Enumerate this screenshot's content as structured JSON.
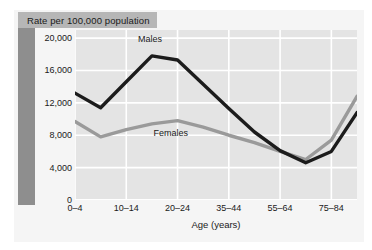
{
  "banner": {
    "text": "Rate per 100,000 population"
  },
  "series_labels": {
    "males": "Males",
    "females": "Females"
  },
  "colors": {
    "males_line": "#1c1c1c",
    "females_line": "#9a9a9a",
    "plot_background": "#e4e4e4",
    "panel_background": "#f5f5f5",
    "banner_background": "#b6b6b6",
    "spine": "#8e8e8e",
    "gridline": "#ffffff"
  },
  "chart_data": {
    "type": "line",
    "title": "Rate per 100,000 population",
    "xlabel": "Age (years)",
    "ylabel": "",
    "ylim": [
      0,
      21000
    ],
    "yticks": [
      0,
      4000,
      8000,
      12000,
      16000,
      20000
    ],
    "ytick_labels": [
      "0",
      "4,000",
      "8,000",
      "12,000",
      "16,000",
      "20,000"
    ],
    "grid": true,
    "legend": "inline-annotations",
    "categories": [
      "0–4",
      "5–9",
      "10–14",
      "15–19",
      "20–24",
      "25–34",
      "35–44",
      "45–54",
      "55–64",
      "65–74",
      "75–84",
      "85+"
    ],
    "xtick_labels": [
      "0–4",
      "10–14",
      "20–24",
      "35–44",
      "55–64",
      "75–84"
    ],
    "xtick_indices": [
      0,
      2,
      4,
      6,
      8,
      10
    ],
    "series": [
      {
        "name": "Males",
        "color": "#1c1c1c",
        "values": [
          13200,
          11400,
          14600,
          17800,
          17300,
          14300,
          11300,
          8400,
          6100,
          4600,
          6000,
          10800
        ]
      },
      {
        "name": "Females",
        "color": "#9a9a9a",
        "values": [
          9700,
          7800,
          8700,
          9400,
          9800,
          9000,
          8000,
          7100,
          6000,
          5000,
          7400,
          12800
        ]
      }
    ],
    "annotations": [
      {
        "text": "Males",
        "x_index": 3,
        "y": 19800
      },
      {
        "text": "Females",
        "x_index": 4,
        "y": 8200
      }
    ]
  }
}
